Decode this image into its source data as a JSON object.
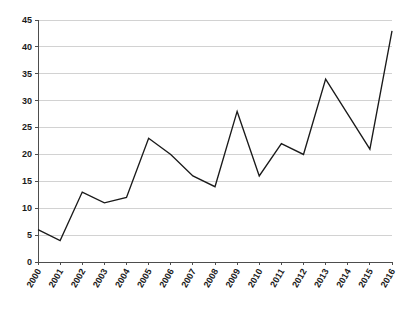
{
  "chart_data": {
    "type": "line",
    "title": "",
    "subtitle": "",
    "xlabel": "",
    "ylabel": "",
    "categories": [
      "2000",
      "2001",
      "2002",
      "2003",
      "2004",
      "2005",
      "2006",
      "2007",
      "2008",
      "2009",
      "2010",
      "2011",
      "2012",
      "2013",
      "2014",
      "2015",
      "2016"
    ],
    "values": [
      6,
      4,
      13,
      11,
      12,
      23,
      20,
      16,
      14,
      28,
      16,
      22,
      20,
      34,
      27.5,
      21,
      43
    ],
    "series": [
      {
        "name": "series-1",
        "values": [
          6,
          4,
          13,
          11,
          12,
          23,
          20,
          16,
          14,
          28,
          16,
          22,
          20,
          34,
          27.5,
          21,
          43
        ]
      }
    ],
    "ylim": [
      0,
      45
    ],
    "yticks": [
      0,
      5,
      10,
      15,
      20,
      25,
      30,
      35,
      40,
      45
    ],
    "ytick_labels": [
      "0",
      "5",
      "10",
      "15",
      "20",
      "25",
      "30",
      "35",
      "40",
      "45"
    ],
    "xtick_labels": [
      "2000",
      "2001",
      "2002",
      "2003",
      "2004",
      "2005",
      "2006",
      "2007",
      "2008",
      "2009",
      "2010",
      "2011",
      "2012",
      "2013",
      "2014",
      "2015",
      "2016"
    ],
    "xtick_rotation_deg": -60,
    "grid": true,
    "grid_axis": "y",
    "legend": false,
    "legend_position": "none",
    "line_color": "#1a1a1a",
    "grid_color": "#bfbfbf",
    "axis_color": "#4d4d4d",
    "background_color": "#ffffff",
    "markers": false,
    "annotations": []
  },
  "figure": {
    "plot_left_px": 38,
    "plot_right_px": 392,
    "plot_top_px": 20,
    "plot_bottom_px": 262
  }
}
